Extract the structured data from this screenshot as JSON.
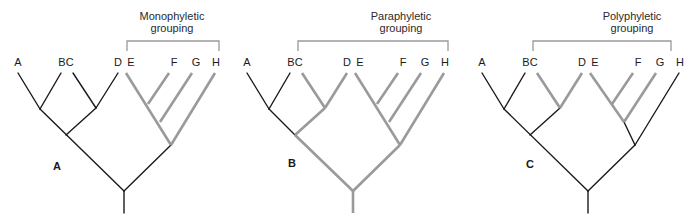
{
  "figure": {
    "colors": {
      "black_branch": "#1a1a1a",
      "highlight_branch": "#9a9a9a",
      "bracket": "#9a9a9a"
    },
    "taxa": [
      "A",
      "B",
      "C",
      "D",
      "E",
      "F",
      "G",
      "H"
    ],
    "panels": [
      {
        "id": "A",
        "label": "A",
        "title_line1": "Monophyletic",
        "title_line2": "grouping",
        "grouped_taxa": [
          "E",
          "F",
          "G",
          "H"
        ],
        "tip_labels": [
          "A",
          "BC",
          "D",
          "E",
          "F",
          "G",
          "H"
        ]
      },
      {
        "id": "B",
        "label": "B",
        "title_line1": "Paraphyletic",
        "title_line2": "grouping",
        "grouped_taxa": [
          "C",
          "D",
          "E",
          "F",
          "G",
          "H"
        ],
        "tip_labels": [
          "A",
          "BC",
          "D",
          "E",
          "F",
          "G",
          "H"
        ]
      },
      {
        "id": "C",
        "label": "C",
        "title_line1": "Polyphyletic",
        "title_line2": "grouping",
        "grouped_taxa": [
          "C",
          "D",
          "E",
          "F",
          "G"
        ],
        "tip_labels": [
          "A",
          "BC",
          "D",
          "E",
          "F",
          "G",
          "H"
        ]
      }
    ]
  }
}
